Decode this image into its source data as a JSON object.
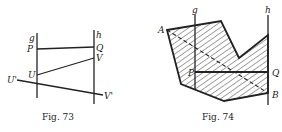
{
  "figures": [
    {
      "id": "fig73",
      "caption": "Fig. 73",
      "lines": {
        "g": {
          "label": "g"
        },
        "h": {
          "label": "h"
        }
      },
      "points": {
        "P": "P",
        "Q": "Q",
        "U": "U",
        "V": "V",
        "U_prime": "U'",
        "V_prime": "V'"
      }
    },
    {
      "id": "fig74",
      "caption": "Fig. 74",
      "lines": {
        "g": {
          "label": "g"
        },
        "h": {
          "label": "h"
        }
      },
      "points": {
        "A": "A",
        "B": "B",
        "P": "P",
        "Q": "Q"
      }
    }
  ],
  "colors": {
    "ink": "#222222",
    "background": "#ffffff"
  }
}
